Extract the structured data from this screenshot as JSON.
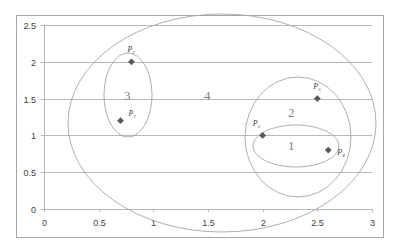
{
  "chart_data": {
    "type": "scatter",
    "title": "",
    "xlabel": "",
    "ylabel": "",
    "xlim": [
      0,
      3
    ],
    "ylim": [
      0,
      2.5
    ],
    "x_ticks": [
      "0",
      "0.5",
      "1",
      "1.5",
      "2",
      "2.5",
      "3"
    ],
    "y_ticks": [
      "0",
      "0.5",
      "1",
      "1.5",
      "2",
      "2.5"
    ],
    "grid": "horizontal",
    "legend": "none",
    "marker": "diamond",
    "marker_color": "#595959",
    "series": [
      {
        "name": "points",
        "points": [
          {
            "label": "P",
            "sub": "1",
            "x": 0.7,
            "y": 1.2
          },
          {
            "label": "P",
            "sub": "2",
            "x": 0.8,
            "y": 2.0
          },
          {
            "label": "P",
            "sub": "3",
            "x": 2.0,
            "y": 1.0
          },
          {
            "label": "P",
            "sub": "4",
            "x": 2.6,
            "y": 0.8
          },
          {
            "label": "P",
            "sub": "5",
            "x": 2.5,
            "y": 1.5
          }
        ]
      }
    ],
    "annotations": [
      {
        "type": "ellipse",
        "label": "1",
        "encloses": [
          "P3",
          "P4"
        ]
      },
      {
        "type": "ellipse",
        "label": "2",
        "encloses": [
          "P3",
          "P4",
          "P5"
        ]
      },
      {
        "type": "ellipse",
        "label": "3",
        "encloses": [
          "P1",
          "P2"
        ]
      },
      {
        "type": "ellipse",
        "label": "4",
        "encloses": [
          "P1",
          "P2",
          "P3",
          "P4",
          "P5"
        ]
      }
    ]
  }
}
